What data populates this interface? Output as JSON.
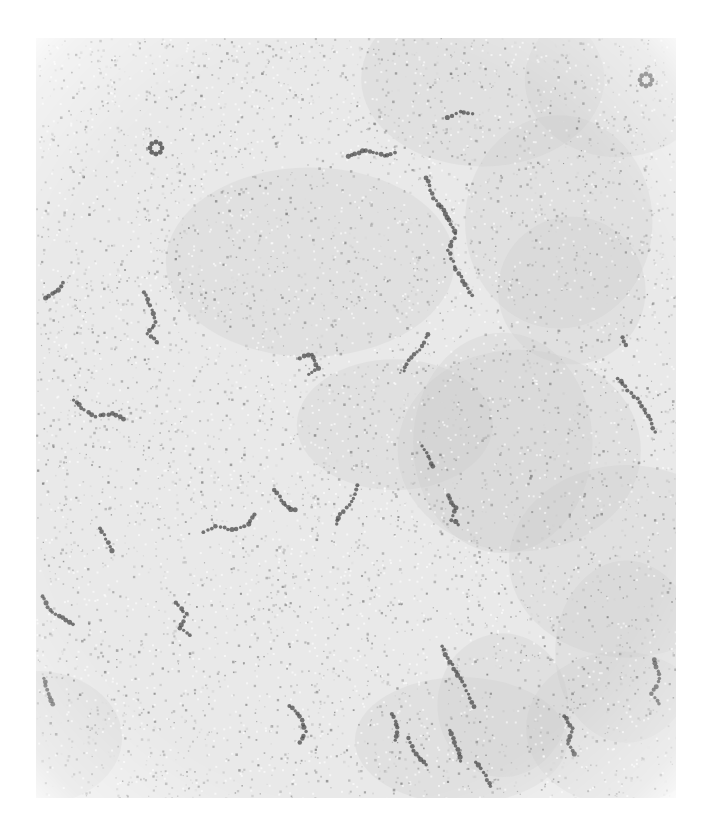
{
  "figure": {
    "type": "electron-micrograph",
    "header_text": "",
    "background_color": "#e9e9e9",
    "fiber_color": "#4a4a4a",
    "bounds": {
      "left": 36,
      "top": 38,
      "width": 640,
      "height": 760
    }
  },
  "fibers": [
    {
      "points": [
        [
          120,
          110
        ],
        [
          126,
          116
        ],
        [
          122,
          122
        ]
      ],
      "kind": "cluster"
    },
    {
      "points": [
        [
          610,
          42
        ],
        [
          616,
          48
        ],
        [
          612,
          54
        ]
      ],
      "kind": "cluster"
    },
    {
      "points": [
        [
          312,
          118
        ],
        [
          330,
          112
        ],
        [
          348,
          118
        ],
        [
          362,
          114
        ]
      ],
      "kind": "strand"
    },
    {
      "points": [
        [
          390,
          140
        ],
        [
          398,
          160
        ],
        [
          410,
          176
        ],
        [
          420,
          196
        ],
        [
          412,
          212
        ],
        [
          420,
          232
        ],
        [
          432,
          250
        ],
        [
          438,
          262
        ]
      ],
      "kind": "strand"
    },
    {
      "points": [
        [
          412,
          80
        ],
        [
          424,
          74
        ],
        [
          440,
          76
        ]
      ],
      "kind": "strand"
    },
    {
      "points": [
        [
          10,
          260
        ],
        [
          22,
          252
        ],
        [
          30,
          242
        ]
      ],
      "kind": "strand"
    },
    {
      "points": [
        [
          108,
          254
        ],
        [
          114,
          268
        ],
        [
          120,
          284
        ],
        [
          112,
          296
        ],
        [
          124,
          306
        ]
      ],
      "kind": "strand"
    },
    {
      "points": [
        [
          264,
          320
        ],
        [
          276,
          316
        ],
        [
          282,
          330
        ],
        [
          270,
          338
        ]
      ],
      "kind": "strand"
    },
    {
      "points": [
        [
          392,
          296
        ],
        [
          384,
          312
        ],
        [
          372,
          322
        ],
        [
          366,
          336
        ]
      ],
      "kind": "strand"
    },
    {
      "points": [
        [
          38,
          362
        ],
        [
          48,
          372
        ],
        [
          60,
          378
        ],
        [
          76,
          376
        ],
        [
          92,
          382
        ]
      ],
      "kind": "strand"
    },
    {
      "points": [
        [
          386,
          408
        ],
        [
          392,
          418
        ],
        [
          398,
          432
        ]
      ],
      "kind": "strand"
    },
    {
      "points": [
        [
          238,
          452
        ],
        [
          246,
          462
        ],
        [
          252,
          470
        ],
        [
          262,
          472
        ]
      ],
      "kind": "strand"
    },
    {
      "points": [
        [
          322,
          448
        ],
        [
          316,
          464
        ],
        [
          304,
          476
        ],
        [
          300,
          490
        ]
      ],
      "kind": "strand"
    },
    {
      "points": [
        [
          412,
          458
        ],
        [
          420,
          470
        ],
        [
          416,
          482
        ],
        [
          426,
          488
        ]
      ],
      "kind": "strand"
    },
    {
      "points": [
        [
          64,
          490
        ],
        [
          72,
          504
        ],
        [
          78,
          516
        ]
      ],
      "kind": "strand"
    },
    {
      "points": [
        [
          168,
          494
        ],
        [
          180,
          488
        ],
        [
          196,
          492
        ],
        [
          212,
          486
        ],
        [
          220,
          474
        ]
      ],
      "kind": "strand"
    },
    {
      "points": [
        [
          6,
          558
        ],
        [
          14,
          572
        ],
        [
          26,
          580
        ],
        [
          40,
          588
        ]
      ],
      "kind": "strand"
    },
    {
      "points": [
        [
          140,
          564
        ],
        [
          150,
          576
        ],
        [
          144,
          590
        ],
        [
          158,
          600
        ]
      ],
      "kind": "strand"
    },
    {
      "points": [
        [
          582,
          340
        ],
        [
          592,
          352
        ],
        [
          604,
          364
        ],
        [
          614,
          382
        ],
        [
          620,
          398
        ]
      ],
      "kind": "strand"
    },
    {
      "points": [
        [
          586,
          300
        ],
        [
          592,
          310
        ]
      ],
      "kind": "strand"
    },
    {
      "points": [
        [
          406,
          608
        ],
        [
          414,
          624
        ],
        [
          424,
          640
        ],
        [
          432,
          656
        ],
        [
          440,
          672
        ]
      ],
      "kind": "strand"
    },
    {
      "points": [
        [
          618,
          622
        ],
        [
          624,
          640
        ],
        [
          616,
          656
        ],
        [
          626,
          668
        ]
      ],
      "kind": "strand"
    },
    {
      "points": [
        [
          254,
          668
        ],
        [
          264,
          678
        ],
        [
          270,
          694
        ],
        [
          262,
          708
        ]
      ],
      "kind": "strand"
    },
    {
      "points": [
        [
          356,
          676
        ],
        [
          362,
          690
        ],
        [
          358,
          706
        ]
      ],
      "kind": "strand"
    },
    {
      "points": [
        [
          372,
          700
        ],
        [
          380,
          716
        ],
        [
          392,
          730
        ]
      ],
      "kind": "strand"
    },
    {
      "points": [
        [
          414,
          692
        ],
        [
          420,
          708
        ],
        [
          426,
          726
        ]
      ],
      "kind": "strand"
    },
    {
      "points": [
        [
          528,
          678
        ],
        [
          536,
          690
        ],
        [
          532,
          706
        ],
        [
          540,
          720
        ]
      ],
      "kind": "strand"
    },
    {
      "points": [
        [
          8,
          640
        ],
        [
          12,
          656
        ],
        [
          18,
          670
        ]
      ],
      "kind": "strand"
    },
    {
      "points": [
        [
          440,
          724
        ],
        [
          450,
          738
        ],
        [
          456,
          752
        ]
      ],
      "kind": "strand"
    }
  ]
}
